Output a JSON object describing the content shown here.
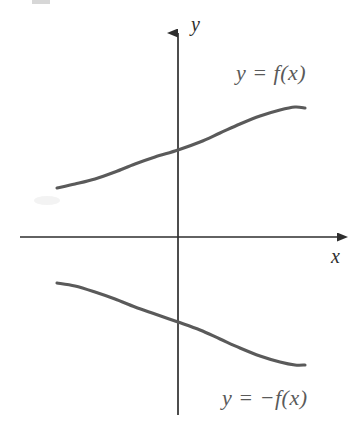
{
  "figure": {
    "kind": "cartesian-graph",
    "width": 357,
    "height": 426,
    "background_color": "#ffffff"
  },
  "axes": {
    "x_axis_label": "x",
    "y_axis_label": "y",
    "axis_color": "#2e2e2e",
    "origin": {
      "x": 178,
      "y": 237
    },
    "x_axis_range_px": [
      20,
      348
    ],
    "y_axis_range_px": [
      22,
      415
    ],
    "arrowheads": [
      "x-positive",
      "y-positive"
    ],
    "ticks": [],
    "tick_labels": [],
    "grid": false
  },
  "labels": {
    "upper_curve": "y = f(x)",
    "lower_curve": "y = −f(x)"
  },
  "chart_data": {
    "type": "line",
    "title": "",
    "xlabel": "x",
    "ylabel": "y",
    "grid": false,
    "legend_position": "inline-annotation",
    "axis_origin_px": {
      "x": 178,
      "y": 237
    },
    "series": [
      {
        "name": "y = f(x)",
        "color": "#5a5a5a",
        "annotation": "y = f(x)",
        "annotation_px": {
          "x": 238,
          "y": 75
        },
        "points_px": [
          {
            "x": 57,
            "y": 188
          },
          {
            "x": 75,
            "y": 184
          },
          {
            "x": 95,
            "y": 179
          },
          {
            "x": 115,
            "y": 172
          },
          {
            "x": 135,
            "y": 164
          },
          {
            "x": 155,
            "y": 157
          },
          {
            "x": 178,
            "y": 150
          },
          {
            "x": 200,
            "y": 142
          },
          {
            "x": 220,
            "y": 133
          },
          {
            "x": 240,
            "y": 124
          },
          {
            "x": 260,
            "y": 116
          },
          {
            "x": 280,
            "y": 110
          },
          {
            "x": 295,
            "y": 107
          },
          {
            "x": 305,
            "y": 108
          }
        ]
      },
      {
        "name": "y = −f(x)",
        "color": "#5a5a5a",
        "annotation": "y = −f(x)",
        "annotation_px": {
          "x": 225,
          "y": 400
        },
        "points_px": [
          {
            "x": 57,
            "y": 283
          },
          {
            "x": 75,
            "y": 286
          },
          {
            "x": 95,
            "y": 292
          },
          {
            "x": 115,
            "y": 299
          },
          {
            "x": 135,
            "y": 307
          },
          {
            "x": 155,
            "y": 314
          },
          {
            "x": 178,
            "y": 322
          },
          {
            "x": 200,
            "y": 330
          },
          {
            "x": 220,
            "y": 339
          },
          {
            "x": 240,
            "y": 348
          },
          {
            "x": 260,
            "y": 356
          },
          {
            "x": 280,
            "y": 362
          },
          {
            "x": 295,
            "y": 365
          },
          {
            "x": 305,
            "y": 365
          }
        ]
      }
    ]
  }
}
